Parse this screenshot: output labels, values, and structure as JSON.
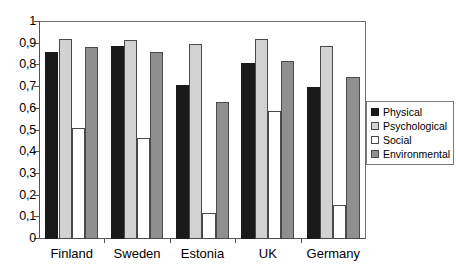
{
  "chart_data": {
    "type": "bar",
    "title": "",
    "subtitle": "",
    "xlabel": "",
    "ylabel": "",
    "categories": [
      "Finland",
      "Sweden",
      "Estonia",
      "UK",
      "Germany"
    ],
    "series": [
      {
        "name": "Physical",
        "color": "#1a1a1a",
        "values": [
          0.86,
          0.89,
          0.71,
          0.81,
          0.7
        ]
      },
      {
        "name": "Psychological",
        "color": "#d2d2d2",
        "values": [
          0.92,
          0.915,
          0.9,
          0.92,
          0.89
        ]
      },
      {
        "name": "Social",
        "color": "#ffffff",
        "values": [
          0.51,
          0.465,
          0.12,
          0.59,
          0.155
        ]
      },
      {
        "name": "Environmental",
        "color": "#8f8f8f",
        "values": [
          0.885,
          0.86,
          0.63,
          0.82,
          0.745
        ]
      }
    ],
    "ylim": [
      0,
      1
    ],
    "ytick_labels": [
      "1",
      "0,9",
      "0,8",
      "0,7",
      "0,6",
      "0,5",
      "0,4",
      "0,3",
      "0,2",
      "0,1",
      "0"
    ],
    "ytick_values": [
      1,
      0.9,
      0.8,
      0.7,
      0.6,
      0.5,
      0.4,
      0.3,
      0.2,
      0.1,
      0
    ],
    "grid": false,
    "legend_position": "right",
    "legend_entries": [
      "Physical",
      "Psychological",
      "Social",
      "Environmental"
    ],
    "annotations": []
  },
  "legend": {
    "items": [
      {
        "label": "Physical"
      },
      {
        "label": "Psychological"
      },
      {
        "label": "Social"
      },
      {
        "label": "Environmental"
      }
    ]
  }
}
